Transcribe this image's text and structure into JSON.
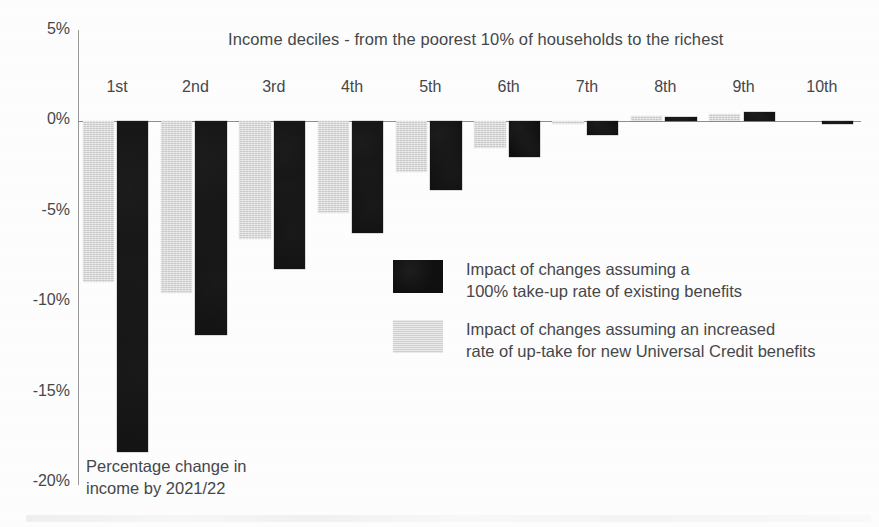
{
  "chart_data": {
    "type": "bar",
    "title": "Income deciles - from the poorest 10% of households to the richest",
    "xlabel": "",
    "ylabel": "Percentage change in income by 2021/22",
    "ylim": [
      -20,
      5
    ],
    "yticks": [
      "5%",
      "0%",
      "-5%",
      "-10%",
      "-15%",
      "-20%"
    ],
    "ytick_values": [
      5,
      0,
      -5,
      -10,
      -15,
      -20
    ],
    "grid": false,
    "legend_position": "center-right",
    "categories": [
      "1st",
      "2nd",
      "3rd",
      "4th",
      "5th",
      "6th",
      "7th",
      "8th",
      "9th",
      "10th"
    ],
    "series": [
      {
        "name": "Impact of changes assuming an increased\nrate of up-take for new Universal Credit benefits",
        "short_name": "increased up-take for new Universal Credit benefits",
        "color": "#d4d4d4",
        "values": [
          -8.9,
          -9.5,
          -6.5,
          -5.1,
          -2.8,
          -1.5,
          -0.1,
          0.3,
          0.4,
          0.0
        ]
      },
      {
        "name": "Impact of changes assuming a\n100% take-up rate of existing benefits",
        "short_name": "100% take-up rate of existing benefits",
        "color": "#101010",
        "values": [
          -18.3,
          -11.8,
          -8.2,
          -6.2,
          -3.8,
          -2.0,
          -0.8,
          0.2,
          0.5,
          -0.15
        ]
      }
    ]
  },
  "legend": {
    "items": [
      {
        "swatch": "dark",
        "label": "Impact of changes assuming a\n100% take-up rate of existing benefits"
      },
      {
        "swatch": "light",
        "label": "Impact of changes assuming an increased\nrate of up-take for new Universal Credit benefits"
      }
    ]
  },
  "footnote": {
    "text": "Percentage change in\nincome by 2021/22"
  }
}
